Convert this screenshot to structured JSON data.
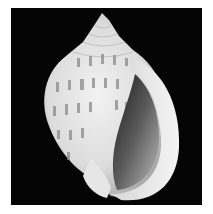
{
  "image": {
    "subject": "Seashell (bonnet shell) on black background",
    "alt": "Photograph of a white spiral seashell with rows of grey rectangular spots, aperture facing right, on a black background",
    "colors": {
      "background": "#050505",
      "border": "#ffffff",
      "shell_light": "#eeeeee",
      "shell_mid": "#c8c8c8",
      "spots": "#8a8a8a",
      "aperture_dark": "#2a2a2a"
    }
  }
}
